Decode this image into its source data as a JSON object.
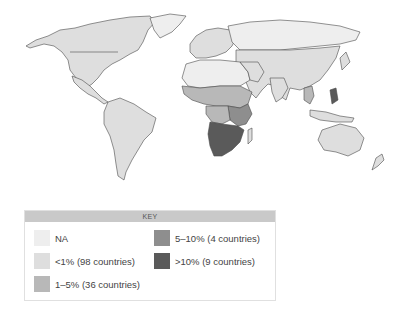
{
  "map": {
    "title": "World map by prevalence category",
    "colors": {
      "na": "#eeeeee",
      "lt1": "#dedede",
      "1to5": "#b8b8b8",
      "5to10": "#8e8e8e",
      "gt10": "#5a5a5a",
      "border": "#4a4a4a"
    }
  },
  "key": {
    "title": "KEY",
    "items": [
      {
        "label": "NA",
        "color": "#eeeeee"
      },
      {
        "label": "<1% (98 countries)",
        "color": "#dedede"
      },
      {
        "label": "1–5% (36 countries)",
        "color": "#b8b8b8"
      },
      {
        "label": "5–10% (4 countries)",
        "color": "#8e8e8e"
      },
      {
        "label": ">10% (9 countries)",
        "color": "#5a5a5a"
      }
    ]
  }
}
